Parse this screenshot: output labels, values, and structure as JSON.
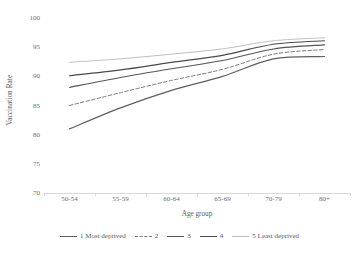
{
  "chart_data": {
    "type": "line",
    "title": "",
    "xlabel": "Age group",
    "ylabel": "Vaccination Rate",
    "categories": [
      "50-54",
      "55-59",
      "60-64",
      "65-69",
      "70-79",
      "80+"
    ],
    "ylim": [
      70,
      100
    ],
    "yticks": [
      70,
      75,
      80,
      85,
      90,
      95,
      100
    ],
    "grid": false,
    "legend_position": "bottom",
    "series": [
      {
        "name": "1 Most deprived",
        "label": "1 Most deprived",
        "style": "solid",
        "color": "#5f5f5f",
        "width": 1.2,
        "values": [
          81.0,
          84.6,
          87.6,
          90.0,
          93.0,
          93.4
        ]
      },
      {
        "name": "2",
        "label": "2",
        "style": "dashed",
        "color": "#7a7a7a",
        "width": 1.0,
        "values": [
          85.0,
          87.2,
          89.3,
          91.2,
          93.8,
          94.6
        ]
      },
      {
        "name": "3",
        "label": "3",
        "style": "solid",
        "color": "#555555",
        "width": 1.1,
        "values": [
          88.1,
          89.8,
          91.3,
          92.7,
          94.7,
          95.4
        ]
      },
      {
        "name": "4",
        "label": "4",
        "style": "solid",
        "color": "#4a4a4a",
        "width": 1.2,
        "values": [
          90.1,
          91.1,
          92.4,
          93.6,
          95.5,
          96.1
        ]
      },
      {
        "name": "5 Least deprived",
        "label": "5 Least deprived",
        "style": "solid",
        "color": "#bfbfbf",
        "width": 1.0,
        "values": [
          92.4,
          93.0,
          93.8,
          94.7,
          96.1,
          96.6
        ]
      }
    ]
  },
  "axis": {
    "y_title": "Vaccination Rate",
    "x_title": "Age group"
  }
}
